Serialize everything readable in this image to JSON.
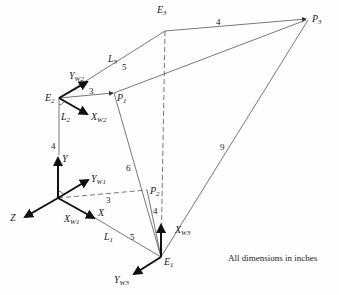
{
  "diagram": {
    "points": {
      "E1": {
        "label": "E",
        "sub": "1"
      },
      "E2": {
        "label": "E",
        "sub": "2"
      },
      "E3": {
        "label": "E",
        "sub": "3"
      },
      "P1": {
        "label": "P",
        "sub": "1"
      },
      "P2": {
        "label": "P",
        "sub": "2"
      },
      "P3": {
        "label": "P",
        "sub": "3"
      }
    },
    "links": {
      "L1": {
        "label": "L",
        "sub": "1"
      },
      "L2": {
        "label": "L",
        "sub": "2"
      },
      "L3": {
        "label": "L",
        "sub": "3"
      }
    },
    "axes": {
      "X": "X",
      "Y": "Y",
      "Z": "Z",
      "Xw1": {
        "label": "X",
        "sub": "W1"
      },
      "Yw1": {
        "label": "Y",
        "sub": "W1"
      },
      "Xw2": {
        "label": "X",
        "sub": "W2"
      },
      "Yw2": {
        "label": "Y",
        "sub": "W2"
      },
      "Xw3": {
        "label": "X",
        "sub": "W3"
      },
      "Yw3": {
        "label": "Y",
        "sub": "W3"
      }
    },
    "dimensions": {
      "E2_P1": "3",
      "E2_E3": "5",
      "E3_P3": "4",
      "E0_E2": "4",
      "E0_P2": "3",
      "E0_E1": "5",
      "P1_E1": "6",
      "P2_E1": "4",
      "P3_E1": "9"
    },
    "note": "All dimensions in inches"
  }
}
